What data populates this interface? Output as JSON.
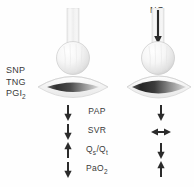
{
  "diagram": {
    "title_text": "",
    "background_color": "#ffffff",
    "ink_color": "#3a3a3a"
  },
  "left_panel": {
    "name": "intravenous-vasodilators",
    "drug_labels": [
      {
        "text": "SNP",
        "sub": ""
      },
      {
        "text": "TNG",
        "sub": ""
      },
      {
        "text": "PGI",
        "sub": "2"
      }
    ],
    "tube_label": ""
  },
  "right_panel": {
    "name": "inhaled-nitric-oxide",
    "gas_label": "NO",
    "gas_direction": "down"
  },
  "parameters": [
    {
      "label": "PAP",
      "left_arrow": "down",
      "right_arrow": "down"
    },
    {
      "label": "SVR",
      "left_arrow": "down",
      "right_arrow": "left-right"
    },
    {
      "label": "Qs/Qt",
      "label_main": "Q",
      "label_sub1": "s",
      "label_slash": "/Q",
      "label_sub2": "t",
      "left_arrow": "up",
      "right_arrow": "down"
    },
    {
      "label": "PaO2",
      "label_main": "PaO",
      "label_sub1": "2",
      "left_arrow": "down",
      "right_arrow": "up"
    }
  ]
}
